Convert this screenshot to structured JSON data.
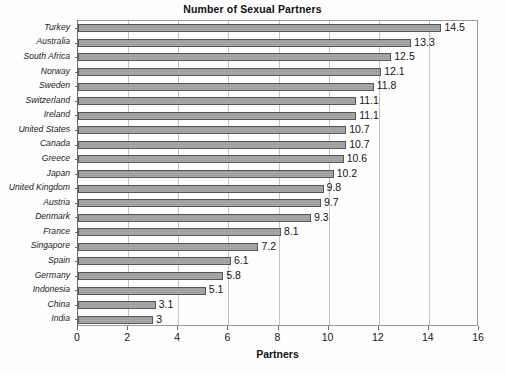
{
  "chart_data": {
    "type": "bar",
    "orientation": "horizontal",
    "title": "Number of Sexual Partners",
    "xlabel": "Partners",
    "ylabel": "",
    "xlim": [
      0,
      16
    ],
    "xticks": [
      0,
      2,
      4,
      6,
      8,
      10,
      12,
      14,
      16
    ],
    "grid": "vertical",
    "legend": "none",
    "bar_color": "#a3a3a3",
    "bar_edge_color": "#565656",
    "categories": [
      "Turkey",
      "Australia",
      "South Africa",
      "Norway",
      "Sweden",
      "Switzerland",
      "Ireland",
      "United States",
      "Canada",
      "Greece",
      "Japan",
      "United Kingdom",
      "Austria",
      "Denmark",
      "France",
      "Singapore",
      "Spain",
      "Germany",
      "Indonesia",
      "China",
      "India"
    ],
    "values": [
      14.5,
      13.3,
      12.5,
      12.1,
      11.8,
      11.1,
      11.1,
      10.7,
      10.7,
      10.6,
      10.2,
      9.8,
      9.7,
      9.3,
      8.1,
      7.2,
      6.1,
      5.8,
      5.1,
      3.1,
      3
    ],
    "value_labels": [
      "14.5",
      "13.3",
      "12.5",
      "12.1",
      "11.8",
      "11.1",
      "11.1",
      "10.7",
      "10.7",
      "10.6",
      "10.2",
      "9.8",
      "9.7",
      "9.3",
      "8.1",
      "7.2",
      "6.1",
      "5.8",
      "5.1",
      "3.1",
      "3"
    ]
  }
}
